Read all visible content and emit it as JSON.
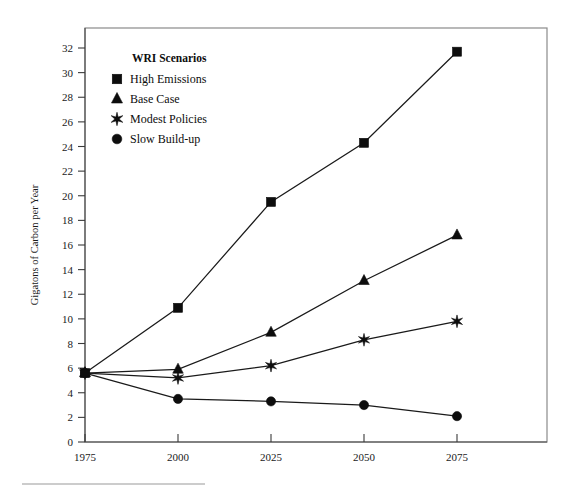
{
  "chart_data": {
    "type": "line",
    "title": "",
    "subtitle": "",
    "xlabel": "",
    "ylabel": "Gigatons of Carbon per Year",
    "x": [
      1975,
      2000,
      2025,
      2050,
      2075
    ],
    "xtick_labels": [
      "1975",
      "2000",
      "2025",
      "2050",
      "2075"
    ],
    "xlim": [
      1975,
      2075
    ],
    "ylim": [
      0,
      33
    ],
    "ytick_labels": [
      "0",
      "2",
      "4",
      "6",
      "8",
      "10",
      "12",
      "14",
      "16",
      "18",
      "20",
      "22",
      "24",
      "26",
      "28",
      "30",
      "32"
    ],
    "ytick_values": [
      0,
      2,
      4,
      6,
      8,
      10,
      12,
      14,
      16,
      18,
      20,
      22,
      24,
      26,
      28,
      30,
      32
    ],
    "grid": false,
    "legend_position": "top-left-inside",
    "legend_title": "WRI Scenarios",
    "series": [
      {
        "name": "High Emissions",
        "marker": "square",
        "color": "#0d0d0d",
        "values": [
          5.6,
          10.9,
          19.5,
          24.3,
          31.7
        ]
      },
      {
        "name": "Base Case",
        "marker": "triangle",
        "color": "#0d0d0d",
        "values": [
          5.6,
          5.9,
          8.9,
          13.1,
          16.8
        ]
      },
      {
        "name": "Modest Policies",
        "marker": "star",
        "color": "#0d0d0d",
        "values": [
          5.6,
          5.2,
          6.2,
          8.3,
          9.8
        ]
      },
      {
        "name": "Slow Build-up",
        "marker": "circle",
        "color": "#0d0d0d",
        "values": [
          5.6,
          3.5,
          3.3,
          3.0,
          2.1
        ]
      }
    ]
  },
  "legend": {
    "title": "WRI Scenarios",
    "items": [
      {
        "label": "High Emissions",
        "marker": "square"
      },
      {
        "label": "Base Case",
        "marker": "triangle"
      },
      {
        "label": "Modest Policies",
        "marker": "star"
      },
      {
        "label": "Slow Build-up",
        "marker": "circle"
      }
    ]
  },
  "axes": {
    "y_title": "Gigatons of Carbon per Year"
  }
}
